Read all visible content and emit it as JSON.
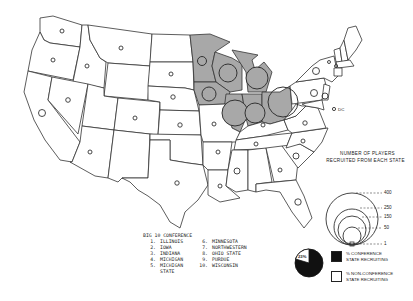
{
  "map": {
    "title": "Big 10 Conference player recruiting by state",
    "region": "Continental United States",
    "highlighted_states": [
      "Minnesota",
      "Wisconsin",
      "Iowa",
      "Illinois",
      "Indiana",
      "Michigan",
      "Ohio"
    ],
    "colors": {
      "big10_fill": "#a8a8a8",
      "state_fill": "#ffffff",
      "outline": "#333333",
      "conference_share": "#111111"
    },
    "dc_label": "DC"
  },
  "scale_legend": {
    "title_line1": "NUMBER OF PLAYERS",
    "title_line2": "RECRUITED FROM EACH STATE",
    "ticks": [
      "400",
      "250",
      "150",
      "50",
      "1"
    ]
  },
  "conference": {
    "heading": "BIG 10 CONFERENCE",
    "members": [
      {
        "num": "1.",
        "name": "ILLINOIS"
      },
      {
        "num": "2.",
        "name": "IOWA"
      },
      {
        "num": "3.",
        "name": "INDIANA"
      },
      {
        "num": "4.",
        "name": "MICHIGAN"
      },
      {
        "num": "5.",
        "name": "MICHIGAN STATE"
      },
      {
        "num": "6.",
        "name": "MINNESOTA"
      },
      {
        "num": "7.",
        "name": "NORTHWESTERN"
      },
      {
        "num": "8.",
        "name": "OHIO STATE"
      },
      {
        "num": "9.",
        "name": "PURDUE"
      },
      {
        "num": "10.",
        "name": "WISCONSIN"
      }
    ]
  },
  "pie_legend": {
    "pct_label": "23%",
    "conference_key_line1": "% CONFERENCE",
    "conference_key_line2": "STATE RECRUITING",
    "nonconference_key_line1": "% NON-CONFERENCE",
    "nonconference_key_line2": "STATE RECRUITING"
  }
}
